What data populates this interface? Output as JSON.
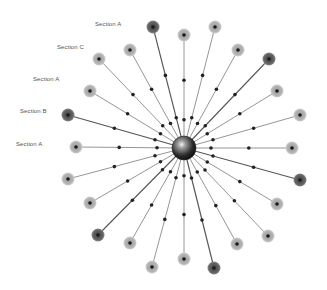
{
  "diagram": {
    "type": "radial-spoke",
    "center": {
      "x": 184,
      "y": 148,
      "r": 12
    },
    "colors": {
      "light_node": "#b4b4b4",
      "dark_node": "#5e5e5e",
      "spoke": "#777777",
      "dot": "#222222",
      "hub": "#3a3a3a"
    },
    "labels": [
      {
        "text": "Section A",
        "x": 95,
        "y": 21
      },
      {
        "text": "Section C",
        "x": 57,
        "y": 44
      },
      {
        "text": "Section A",
        "x": 33,
        "y": 76
      },
      {
        "text": "Section B",
        "x": 20,
        "y": 108
      },
      {
        "text": "Section A",
        "x": 16,
        "y": 141
      }
    ],
    "nodes": [
      {
        "x": 153,
        "y": 27,
        "tone": "dark"
      },
      {
        "x": 184,
        "y": 35,
        "tone": "light"
      },
      {
        "x": 215,
        "y": 27,
        "tone": "light"
      },
      {
        "x": 238,
        "y": 50,
        "tone": "light"
      },
      {
        "x": 269,
        "y": 59,
        "tone": "dark"
      },
      {
        "x": 277,
        "y": 91,
        "tone": "light"
      },
      {
        "x": 300,
        "y": 115,
        "tone": "light"
      },
      {
        "x": 292,
        "y": 148,
        "tone": "light"
      },
      {
        "x": 300,
        "y": 180,
        "tone": "dark"
      },
      {
        "x": 277,
        "y": 204,
        "tone": "light"
      },
      {
        "x": 268,
        "y": 236,
        "tone": "light"
      },
      {
        "x": 237,
        "y": 244,
        "tone": "light"
      },
      {
        "x": 214,
        "y": 268,
        "tone": "dark"
      },
      {
        "x": 184,
        "y": 259,
        "tone": "light"
      },
      {
        "x": 152,
        "y": 267,
        "tone": "light"
      },
      {
        "x": 130,
        "y": 243,
        "tone": "light"
      },
      {
        "x": 98,
        "y": 235,
        "tone": "dark"
      },
      {
        "x": 90,
        "y": 203,
        "tone": "light"
      },
      {
        "x": 68,
        "y": 179,
        "tone": "light"
      },
      {
        "x": 76,
        "y": 147,
        "tone": "light"
      },
      {
        "x": 68,
        "y": 115,
        "tone": "dark"
      },
      {
        "x": 90,
        "y": 91,
        "tone": "light"
      },
      {
        "x": 99,
        "y": 59,
        "tone": "light"
      },
      {
        "x": 130,
        "y": 50,
        "tone": "light"
      }
    ]
  }
}
